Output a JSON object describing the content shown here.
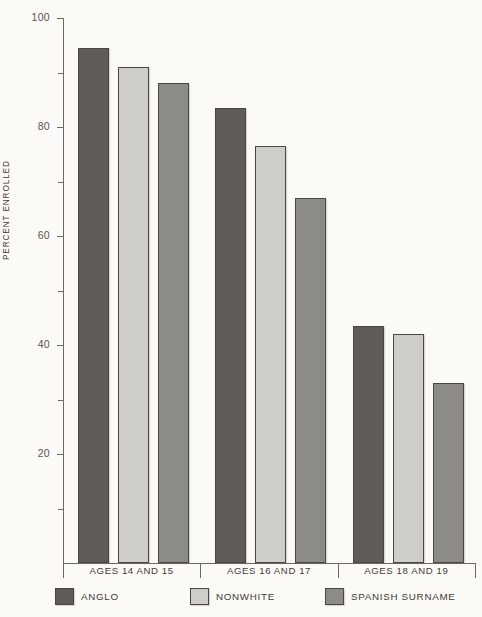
{
  "chart_data": {
    "type": "bar",
    "title": "",
    "xlabel": "",
    "ylabel": "PERCENT ENROLLED",
    "ylim": [
      0,
      100
    ],
    "grid": false,
    "legend_position": "bottom",
    "categories": [
      "AGES 14 AND 15",
      "AGES 16 AND 17",
      "AGES 18 AND 19"
    ],
    "y_ticks_major": [
      100,
      80,
      60,
      40,
      20
    ],
    "y_ticks_minor": [
      90,
      70,
      50,
      30,
      10
    ],
    "y_tick_labels": [
      "100",
      "80",
      "60",
      "40",
      "20"
    ],
    "series": [
      {
        "name": "ANGLO",
        "color": "#5f5b57",
        "values": [
          94.5,
          83.5,
          43.5
        ]
      },
      {
        "name": "NONWHITE",
        "color": "#cfcdc8",
        "values": [
          91.0,
          76.5,
          42.0
        ]
      },
      {
        "name": "SPANISH SURNAME",
        "color": "#8d8b88",
        "values": [
          88.0,
          67.0,
          33.0
        ]
      }
    ]
  },
  "axis": {
    "y_title": "PERCENT ENROLLED",
    "ticks": [
      {
        "label": "100",
        "value": 100,
        "major": true
      },
      {
        "label": "",
        "value": 90,
        "major": false
      },
      {
        "label": "80",
        "value": 80,
        "major": true
      },
      {
        "label": "",
        "value": 70,
        "major": false
      },
      {
        "label": "60",
        "value": 60,
        "major": true
      },
      {
        "label": "",
        "value": 50,
        "major": false
      },
      {
        "label": "40",
        "value": 40,
        "major": true
      },
      {
        "label": "",
        "value": 30,
        "major": false
      },
      {
        "label": "20",
        "value": 20,
        "major": true
      },
      {
        "label": "",
        "value": 10,
        "major": false
      }
    ]
  },
  "groups": [
    {
      "label": "AGES 14 AND 15"
    },
    {
      "label": "AGES 16 AND 17"
    },
    {
      "label": "AGES 18 AND 19"
    }
  ],
  "legend": [
    {
      "label": "ANGLO",
      "color": "#5f5b57"
    },
    {
      "label": "NONWHITE",
      "color": "#cfcdc8"
    },
    {
      "label": "SPANISH SURNAME",
      "color": "#8d8b88"
    }
  ],
  "colors": {
    "background": "#fbfaf7",
    "axis": "#6d6a66",
    "text": "#3f3b38",
    "tick_label": "#58544f",
    "bar_outline": "#4a4643",
    "anglo": "#5f5b57",
    "nonwhite": "#cfcdc8",
    "spanish_surname": "#8d8b88"
  }
}
